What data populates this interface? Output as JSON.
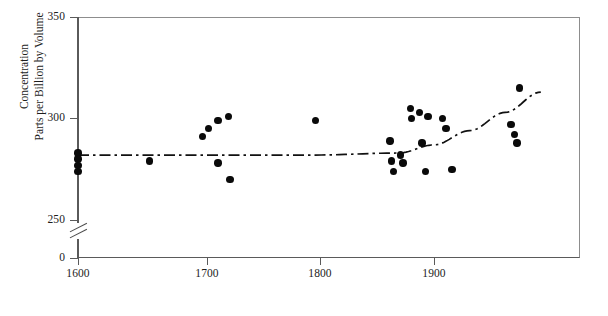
{
  "axes": {
    "y_title_line1": "Concentration",
    "y_title_line2": "Parts per Billion by Volume",
    "y_ticks": [
      "350",
      "300",
      "250",
      "0"
    ],
    "x_ticks": [
      "1600",
      "1700",
      "1800",
      "1900"
    ],
    "break_symbol": "double-slash"
  },
  "chart_data": {
    "type": "scatter",
    "title": "",
    "xlabel": "",
    "ylabel": "Concentration Parts per Billion by Volume",
    "xlim": [
      1580,
      1995
    ],
    "ylim": [
      250,
      350
    ],
    "y_broken_axis_zero": true,
    "grid": false,
    "legend": "none",
    "marker": "filled-circle",
    "x_tick_values": [
      1600,
      1700,
      1800,
      1900
    ],
    "y_tick_values": [
      350,
      300,
      250,
      0
    ],
    "points": [
      {
        "x": 1600,
        "y": 283
      },
      {
        "x": 1600,
        "y": 280
      },
      {
        "x": 1600,
        "y": 277
      },
      {
        "x": 1600,
        "y": 274
      },
      {
        "x": 1660,
        "y": 279
      },
      {
        "x": 1705,
        "y": 291
      },
      {
        "x": 1710,
        "y": 295
      },
      {
        "x": 1718,
        "y": 299
      },
      {
        "x": 1718,
        "y": 278
      },
      {
        "x": 1727,
        "y": 301
      },
      {
        "x": 1728,
        "y": 270
      },
      {
        "x": 1800,
        "y": 299
      },
      {
        "x": 1863,
        "y": 289
      },
      {
        "x": 1864,
        "y": 279
      },
      {
        "x": 1866,
        "y": 274
      },
      {
        "x": 1872,
        "y": 282
      },
      {
        "x": 1874,
        "y": 278
      },
      {
        "x": 1880,
        "y": 305
      },
      {
        "x": 1881,
        "y": 300
      },
      {
        "x": 1888,
        "y": 303
      },
      {
        "x": 1890,
        "y": 288
      },
      {
        "x": 1893,
        "y": 274
      },
      {
        "x": 1895,
        "y": 301
      },
      {
        "x": 1907,
        "y": 300
      },
      {
        "x": 1910,
        "y": 295
      },
      {
        "x": 1915,
        "y": 275
      },
      {
        "x": 1965,
        "y": 297
      },
      {
        "x": 1968,
        "y": 292
      },
      {
        "x": 1970,
        "y": 288
      },
      {
        "x": 1972,
        "y": 315
      }
    ],
    "trend_line": {
      "style": "dash-dot",
      "color": "#111111",
      "description": "flat near 282 ppbv from 1600 to ~1890 then curving upward to ~312 by 1990",
      "x": [
        1600,
        1700,
        1800,
        1870,
        1900,
        1930,
        1960,
        1990
      ],
      "y": [
        282,
        282,
        282,
        283,
        287,
        294,
        303,
        313
      ]
    }
  }
}
